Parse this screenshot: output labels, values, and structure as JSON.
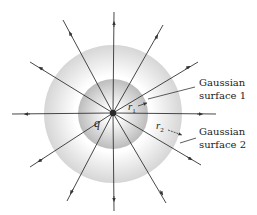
{
  "diagram": {
    "charge": {
      "label": "q",
      "cx": 113,
      "cy": 113,
      "r": 3.2,
      "color": "#2a2a2a"
    },
    "surfaces": [
      {
        "name": "gaussian-surface-2",
        "cx": 113,
        "cy": 114,
        "r": 69,
        "color_inner": "#ffffff",
        "color_outer": "#d4d4d4"
      },
      {
        "name": "gaussian-surface-1",
        "cx": 113,
        "cy": 114,
        "r": 35,
        "color_inner": "#ffffff",
        "color_outer": "#bdbdbd"
      }
    ],
    "field_lines": [
      {
        "x2": 114,
        "y2": 12,
        "ax": 114,
        "ay": 25
      },
      {
        "x2": 63,
        "y2": 20,
        "ax": 71,
        "ay": 35
      },
      {
        "x2": 163,
        "y2": 25,
        "ax": 156,
        "ay": 38
      },
      {
        "x2": 30,
        "y2": 62,
        "ax": 42,
        "ay": 69
      },
      {
        "x2": 198,
        "y2": 62,
        "ax": 187,
        "ay": 68
      },
      {
        "x2": 12,
        "y2": 114,
        "ax": 28,
        "ay": 114
      },
      {
        "x2": 216,
        "y2": 114,
        "ax": 199,
        "ay": 114
      },
      {
        "x2": 30,
        "y2": 167,
        "ax": 41,
        "ay": 160
      },
      {
        "x2": 201,
        "y2": 165,
        "ax": 189,
        "ay": 158
      },
      {
        "x2": 67,
        "y2": 201,
        "ax": 72,
        "ay": 191
      },
      {
        "x2": 166,
        "y2": 203,
        "ax": 161,
        "ay": 192
      },
      {
        "x2": 114,
        "y2": 211,
        "ax": 114,
        "ay": 198
      }
    ],
    "line_color": "#333333",
    "labels": {
      "q": "q",
      "r1": "r",
      "r1_sub": "1",
      "r2": "r",
      "r2_sub": "2",
      "surface1_line1": "Gaussian",
      "surface1_line2": "surface 1",
      "surface2_line1": "Gaussian",
      "surface2_line2": "surface 2"
    }
  }
}
